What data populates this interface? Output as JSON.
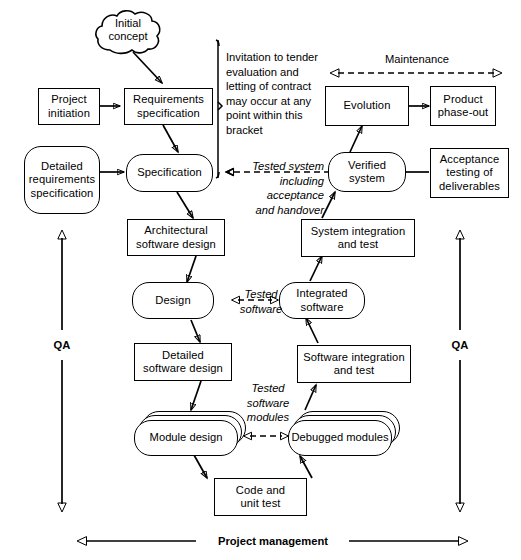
{
  "diagram": {
    "nodes": {
      "initial_concept": "Initial\nconcept",
      "project_initiation": "Project\ninitiation",
      "requirements_specification": "Requirements\nspecification",
      "detailed_requirements_specification": "Detailed\nrequirements\nspecification",
      "specification": "Specification",
      "architectural_software_design": "Architectural\nsoftware design",
      "design": "Design",
      "detailed_software_design": "Detailed\nsoftware design",
      "module_design": "Module design",
      "code_and_unit_test": "Code and\nunit test",
      "debugged_modules": "Debugged\nmodules",
      "software_integration_and_test": "Software integration\nand test",
      "integrated_software": "Integrated\nsoftware",
      "system_integration_and_test": "System integration\nand test",
      "verified_system": "Verified\nsystem",
      "acceptance_testing_of_deliverables": "Acceptance\ntesting of\ndeliverables",
      "evolution": "Evolution",
      "product_phase_out": "Product\nphase-out"
    },
    "labels": {
      "bracket_note": "Invitation to tender\nevaluation and\nletting of contract\nmay occur at any\npoint within this\nbracket",
      "maintenance": "Maintenance",
      "tested_system": "Tested system\nincluding\nacceptance\nand handover",
      "tested_software": "Tested\nsoftware",
      "tested_software_modules": "Tested\nsoftware\nmodules",
      "qa_left": "QA",
      "qa_right": "QA",
      "project_management": "Project management"
    },
    "colors": {
      "stroke": "#000000",
      "background": "#ffffff",
      "text": "#000000"
    }
  }
}
